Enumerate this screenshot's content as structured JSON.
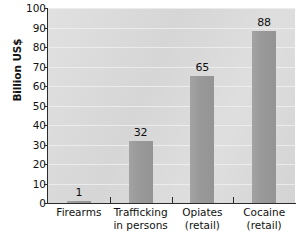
{
  "chart_data": {
    "type": "bar",
    "title": "",
    "xlabel": "",
    "ylabel": "Billion US$",
    "categories": [
      "Firearms",
      "Trafficking in persons",
      "Opiates (retail)",
      "Cocaine (retail)"
    ],
    "category_lines": [
      [
        "Firearms",
        ""
      ],
      [
        "Trafficking",
        "in persons"
      ],
      [
        "Opiates",
        "(retail)"
      ],
      [
        "Cocaine",
        "(retail)"
      ]
    ],
    "values": [
      1,
      32,
      65,
      88
    ],
    "value_labels": [
      "1",
      "32",
      "65",
      "88"
    ],
    "ylim": [
      0,
      100
    ],
    "ytick_values": [
      0,
      10,
      20,
      30,
      40,
      50,
      60,
      70,
      80,
      90,
      100
    ],
    "ytick_labels": [
      "0",
      "10",
      "20",
      "30",
      "40",
      "50",
      "60",
      "70",
      "80",
      "90",
      "100"
    ],
    "grid": true,
    "legend": "none",
    "colors": {
      "bar": "#9a9a9a",
      "plot_background": "#dadada",
      "gridline": "#efefef",
      "axis": "#2b2b2b",
      "text": "#111111",
      "page_background": "#ffffff"
    }
  }
}
